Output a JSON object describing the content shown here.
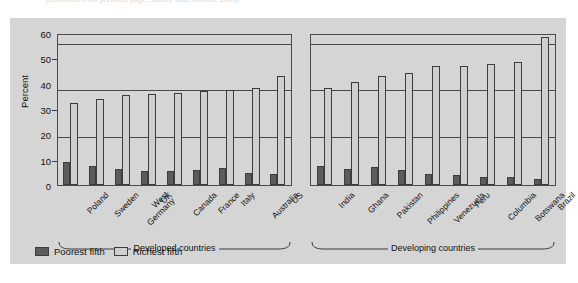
{
  "caption_fragment": "(continued from previous page; source data omitted, 2003)",
  "chart_data": {
    "type": "bar",
    "title": "",
    "xlabel": "",
    "ylabel": "Percent",
    "ylim": [
      0,
      65
    ],
    "yticks": [
      0,
      10,
      20,
      30,
      40,
      50,
      60
    ],
    "gridlines": [
      20,
      40,
      60
    ],
    "grid": true,
    "legend_position": "bottom-left",
    "series": [
      {
        "name": "Poorest fifth",
        "color": "#5b5b5b"
      },
      {
        "name": "Richest fifth",
        "color": "#cfcfcf"
      }
    ],
    "panels": [
      {
        "name": "Developed countries",
        "categories": [
          "Poland",
          "Sweden",
          "West Germany",
          "UK",
          "Canada",
          "France",
          "Italy",
          "Australia",
          "US"
        ],
        "poorest_fifth": [
          9.7,
          8.0,
          7.0,
          6.0,
          6.1,
          6.3,
          7.1,
          5.0,
          4.7
        ],
        "richest_fifth": [
          35.0,
          36.6,
          38.5,
          39.1,
          39.5,
          40.1,
          40.6,
          41.5,
          46.5
        ]
      },
      {
        "name": "Developing countries",
        "categories": [
          "India",
          "Ghana",
          "Pakistan",
          "Philippines",
          "Venezuela",
          "Peru",
          "Columbia",
          "Botswana",
          "Brazil"
        ],
        "poorest_fifth": [
          8.1,
          6.7,
          7.8,
          6.5,
          4.7,
          4.4,
          3.6,
          3.6,
          2.5
        ],
        "richest_fifth": [
          41.3,
          44.1,
          46.7,
          48.1,
          50.8,
          51.1,
          51.8,
          52.8,
          63.2
        ]
      }
    ]
  },
  "legend": {
    "poorest_label": "Poorest fifth",
    "richest_label": "Richest fifth"
  },
  "axis": {
    "y_title": "Percent",
    "tick_60": "60",
    "tick_50": "50",
    "tick_40": "40",
    "tick_30": "30",
    "tick_20": "20",
    "tick_10": "10",
    "tick_0": "0"
  }
}
